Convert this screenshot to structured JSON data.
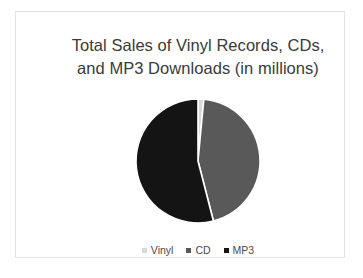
{
  "chart_data": {
    "type": "pie",
    "title": "Total Sales of Vinyl Records, CDs, and MP3 Downloads (in millions)",
    "title_lines": [
      "Total Sales of Vinyl Records, CDs,",
      "and MP3 Downloads (in millions)"
    ],
    "categories": [
      "Vinyl",
      "CD",
      "MP3"
    ],
    "values": [
      1.5,
      44.5,
      54.0
    ],
    "unit": "millions",
    "colors": [
      "#d9d9d9",
      "#595959",
      "#141414"
    ],
    "legend_position": "bottom",
    "grid": false,
    "start_angle_deg": 0,
    "direction": "clockwise",
    "slices": [
      {
        "label": "Vinyl",
        "value": 1.5,
        "percent": 1.5,
        "color": "#d9d9d9",
        "start_deg": 0,
        "sweep_deg": 5.4
      },
      {
        "label": "CD",
        "value": 44.5,
        "percent": 44.5,
        "color": "#595959",
        "start_deg": 5.4,
        "sweep_deg": 160.2
      },
      {
        "label": "MP3",
        "value": 54.0,
        "percent": 54.0,
        "color": "#141414",
        "start_deg": 165.6,
        "sweep_deg": 194.4
      }
    ]
  },
  "legend": {
    "items": [
      {
        "label": "Vinyl",
        "color": "#d9d9d9"
      },
      {
        "label": "CD",
        "color": "#595959"
      },
      {
        "label": "MP3",
        "color": "#141414"
      }
    ]
  },
  "colors": {
    "background": "#ffffff",
    "frame_border": "#e3e3e3",
    "title_text": "#3a3a3a",
    "legend_text": "#4a4a4a",
    "slice_separator": "#ffffff"
  }
}
